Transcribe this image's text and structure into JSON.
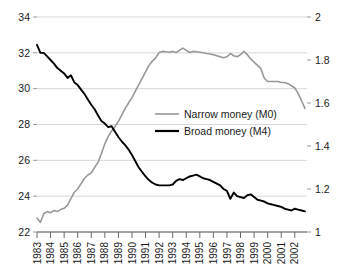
{
  "chart_data": {
    "type": "line",
    "title": "",
    "xlabel": "",
    "ylabel": "",
    "grid": true,
    "legend_position": "center",
    "x_range": [
      1983.0,
      2002.9
    ],
    "xticks": [
      "1983",
      "1984",
      "1985",
      "1986",
      "1987",
      "1988",
      "1989",
      "1990",
      "1991",
      "1992",
      "1993",
      "1994",
      "1995",
      "1996",
      "1997",
      "1998",
      "1999",
      "2000",
      "2001",
      "2002"
    ],
    "left_axis": {
      "label": "",
      "ylim": [
        22,
        34
      ],
      "ticks": [
        "22",
        "24",
        "26",
        "28",
        "30",
        "32",
        "34"
      ],
      "series": "Broad money (M4)"
    },
    "right_axis": {
      "label": "",
      "ylim": [
        1,
        2
      ],
      "ticks": [
        "1",
        "1.2",
        "1.4",
        "1.6",
        "1.8",
        "2"
      ],
      "series": "Narrow money (M0)"
    },
    "series": [
      {
        "name": "Narrow money (M0)",
        "axis": "right",
        "color": "#999999",
        "x": [
          1983.0,
          1983.25,
          1983.5,
          1983.75,
          1984.0,
          1984.25,
          1984.5,
          1984.75,
          1985.0,
          1985.25,
          1985.5,
          1985.75,
          1986.0,
          1986.25,
          1986.5,
          1986.75,
          1987.0,
          1987.25,
          1987.5,
          1987.75,
          1988.0,
          1988.25,
          1988.5,
          1988.75,
          1989.0,
          1989.25,
          1989.5,
          1989.75,
          1990.0,
          1990.25,
          1990.5,
          1990.75,
          1991.0,
          1991.25,
          1991.5,
          1991.75,
          1992.0,
          1992.25,
          1992.5,
          1992.75,
          1993.0,
          1993.25,
          1993.5,
          1993.75,
          1994.0,
          1994.25,
          1994.5,
          1994.75,
          1995.0,
          1995.25,
          1995.5,
          1995.75,
          1996.0,
          1996.25,
          1996.5,
          1996.75,
          1997.0,
          1997.25,
          1997.5,
          1997.75,
          1998.0,
          1998.25,
          1998.5,
          1998.75,
          1999.0,
          1999.25,
          1999.5,
          1999.75,
          2000.0,
          2000.25,
          2000.5,
          2000.75,
          2001.0,
          2001.25,
          2001.5,
          2001.75,
          2002.0,
          2002.25,
          2002.5,
          2002.75
        ],
        "values": [
          1.065,
          1.045,
          1.085,
          1.095,
          1.09,
          1.1,
          1.095,
          1.105,
          1.11,
          1.125,
          1.155,
          1.185,
          1.2,
          1.225,
          1.25,
          1.265,
          1.275,
          1.3,
          1.325,
          1.365,
          1.41,
          1.445,
          1.47,
          1.49,
          1.515,
          1.545,
          1.575,
          1.6,
          1.625,
          1.655,
          1.685,
          1.715,
          1.745,
          1.775,
          1.795,
          1.81,
          1.835,
          1.84,
          1.838,
          1.836,
          1.84,
          1.835,
          1.845,
          1.855,
          1.845,
          1.835,
          1.84,
          1.838,
          1.836,
          1.834,
          1.83,
          1.828,
          1.825,
          1.82,
          1.815,
          1.81,
          1.815,
          1.83,
          1.82,
          1.815,
          1.825,
          1.84,
          1.825,
          1.805,
          1.79,
          1.775,
          1.76,
          1.715,
          1.7,
          1.7,
          1.7,
          1.7,
          1.695,
          1.695,
          1.69,
          1.68,
          1.67,
          1.645,
          1.61,
          1.575
        ]
      },
      {
        "name": "Broad money (M4)",
        "axis": "left",
        "color": "#000000",
        "x": [
          1983.0,
          1983.25,
          1983.5,
          1983.75,
          1984.0,
          1984.25,
          1984.5,
          1984.75,
          1985.0,
          1985.25,
          1985.5,
          1985.75,
          1986.0,
          1986.25,
          1986.5,
          1986.75,
          1987.0,
          1987.25,
          1987.5,
          1987.75,
          1988.0,
          1988.25,
          1988.5,
          1988.75,
          1989.0,
          1989.25,
          1989.5,
          1989.75,
          1990.0,
          1990.25,
          1990.5,
          1990.75,
          1991.0,
          1991.25,
          1991.5,
          1991.75,
          1992.0,
          1992.25,
          1992.5,
          1992.75,
          1993.0,
          1993.25,
          1993.5,
          1993.75,
          1994.0,
          1994.25,
          1994.5,
          1994.75,
          1995.0,
          1995.25,
          1995.5,
          1995.75,
          1996.0,
          1996.25,
          1996.5,
          1996.75,
          1997.0,
          1997.25,
          1997.5,
          1997.75,
          1998.0,
          1998.25,
          1998.5,
          1998.75,
          1999.0,
          1999.25,
          1999.5,
          1999.75,
          2000.0,
          2000.25,
          2000.5,
          2000.75,
          2001.0,
          2001.25,
          2001.5,
          2001.75,
          2002.0,
          2002.25,
          2002.5,
          2002.75
        ],
        "values": [
          32.45,
          32.0,
          32.0,
          31.8,
          31.6,
          31.4,
          31.15,
          31.0,
          30.85,
          30.6,
          30.75,
          30.35,
          30.2,
          29.95,
          29.7,
          29.4,
          29.1,
          28.85,
          28.5,
          28.2,
          28.05,
          27.85,
          27.9,
          27.6,
          27.3,
          27.05,
          26.85,
          26.6,
          26.3,
          25.95,
          25.6,
          25.35,
          25.1,
          24.9,
          24.75,
          24.65,
          24.6,
          24.6,
          24.6,
          24.6,
          24.65,
          24.85,
          24.95,
          24.9,
          25.0,
          25.1,
          25.15,
          25.2,
          25.1,
          25.0,
          24.95,
          24.9,
          24.8,
          24.7,
          24.6,
          24.4,
          24.3,
          23.85,
          24.2,
          24.0,
          23.95,
          23.9,
          24.05,
          24.1,
          23.95,
          23.8,
          23.75,
          23.7,
          23.6,
          23.55,
          23.5,
          23.45,
          23.4,
          23.3,
          23.25,
          23.2,
          23.3,
          23.25,
          23.2,
          23.15
        ]
      }
    ]
  },
  "legend": {
    "items": [
      {
        "label": "Narrow money (M0)",
        "color": "#999999"
      },
      {
        "label": "Broad money (M4)",
        "color": "#000000"
      }
    ]
  }
}
